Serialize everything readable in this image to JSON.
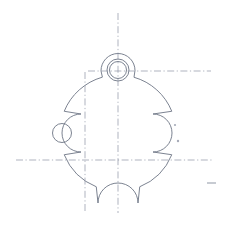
{
  "drawing": {
    "title": "Mechanical Part Outline Drawing",
    "view_label": "",
    "canvas": {
      "width": 235,
      "height": 230,
      "background": "#ffffff"
    },
    "colors": {
      "outline": "#6d7585",
      "centerline": "#8d93a3",
      "punch_mark": "#a6abb8",
      "background": "#ffffff"
    },
    "body": {
      "name": "main-body-circle",
      "center_x": 118,
      "center_y": 133,
      "radius": 58
    },
    "lugs": [
      {
        "name": "top-lug",
        "center_x": 118,
        "center_y": 70,
        "boss_radius": 17,
        "hole_outer_radius": 11,
        "hole_inner_radius": 8.5,
        "has_hole": true
      },
      {
        "name": "left-lug",
        "center_x": 62,
        "center_y": 133,
        "boss_radius": 19,
        "hole_outer_radius": 9.5,
        "hole_inner_radius": 9.5,
        "has_hole": true
      },
      {
        "name": "right-lug",
        "center_x": 172,
        "center_y": 133,
        "boss_radius": 19,
        "hole_outer_radius": 0,
        "hole_inner_radius": 0,
        "has_hole": false
      }
    ],
    "notch": {
      "name": "bottom-notch",
      "center_x": 118,
      "center_y": 203,
      "radius": 20
    },
    "centerlines": [
      {
        "name": "vertical-main-centerline",
        "orientation": "vertical",
        "position": 118,
        "start": 13,
        "end": 213
      },
      {
        "name": "vertical-secondary-centerline",
        "orientation": "vertical",
        "position": 85,
        "start": 72,
        "end": 211
      },
      {
        "name": "horizontal-main-centerline",
        "orientation": "horizontal",
        "position": 160,
        "start": 16,
        "end": 213
      },
      {
        "name": "horizontal-upper-centerline",
        "orientation": "horizontal",
        "position": 71,
        "start": 88,
        "end": 211
      }
    ],
    "punch_marks": [
      {
        "name": "punch-mark-upper",
        "x": 175,
        "y": 125,
        "radius": 1.1
      },
      {
        "name": "punch-mark-lower",
        "x": 178,
        "y": 141,
        "radius": 1.2
      }
    ],
    "stray_tick": {
      "name": "stray-tick-mark",
      "x1": 207,
      "y1": 183,
      "x2": 216,
      "y2": 183
    }
  }
}
